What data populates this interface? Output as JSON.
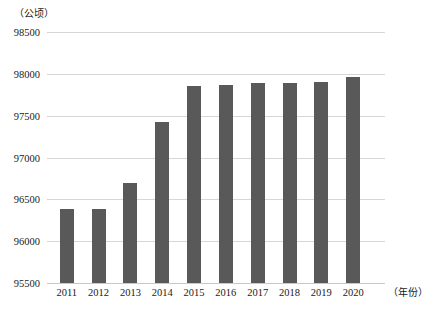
{
  "chart_data": {
    "type": "bar",
    "title": "",
    "subtitle": "",
    "unit_label": "（公顷）",
    "xlabel": "（年份）",
    "ylabel": "",
    "categories": [
      "2011",
      "2012",
      "2013",
      "2014",
      "2015",
      "2016",
      "2017",
      "2018",
      "2019",
      "2020"
    ],
    "values": [
      96380,
      96390,
      96700,
      97430,
      97860,
      97865,
      97890,
      97895,
      97900,
      97960
    ],
    "series": [
      {
        "name": "耕地面积",
        "values": [
          96380,
          96390,
          96700,
          97430,
          97860,
          97865,
          97890,
          97895,
          97900,
          97960
        ]
      }
    ],
    "ylim": [
      95500,
      98500
    ],
    "yticks": [
      95500,
      96000,
      96500,
      97000,
      97500,
      98000,
      98500
    ],
    "ytick_labels": [
      "95500",
      "96000",
      "96500",
      "97000",
      "97500",
      "98000",
      "98500"
    ],
    "grid": true,
    "grid_axis": "y",
    "legend": false,
    "legend_position": "none",
    "bar_color": "#595959",
    "grid_color": "#d6d6d6",
    "background_color": "#ffffff"
  }
}
